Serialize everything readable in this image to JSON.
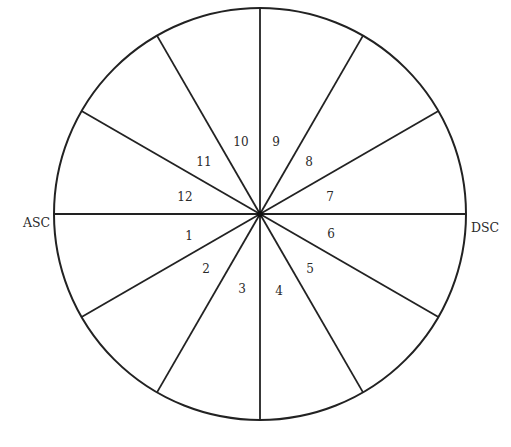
{
  "diagram": {
    "type": "astrological-house-wheel",
    "center": {
      "x": 260,
      "y": 214
    },
    "radius": 206,
    "stroke_color": "#222222",
    "background": "#ffffff",
    "divisions": 12,
    "axis_labels": {
      "left": "ASC",
      "right": "DSC"
    },
    "houses": [
      {
        "number": "1",
        "x": 189,
        "y": 240
      },
      {
        "number": "2",
        "x": 206,
        "y": 273
      },
      {
        "number": "3",
        "x": 242,
        "y": 293
      },
      {
        "number": "4",
        "x": 279,
        "y": 295
      },
      {
        "number": "5",
        "x": 310,
        "y": 273
      },
      {
        "number": "6",
        "x": 331,
        "y": 238
      },
      {
        "number": "7",
        "x": 330,
        "y": 201
      },
      {
        "number": "8",
        "x": 309,
        "y": 166
      },
      {
        "number": "9",
        "x": 276,
        "y": 146
      },
      {
        "number": "10",
        "x": 241,
        "y": 146
      },
      {
        "number": "11",
        "x": 204,
        "y": 166
      },
      {
        "number": "12",
        "x": 185,
        "y": 201
      }
    ]
  }
}
